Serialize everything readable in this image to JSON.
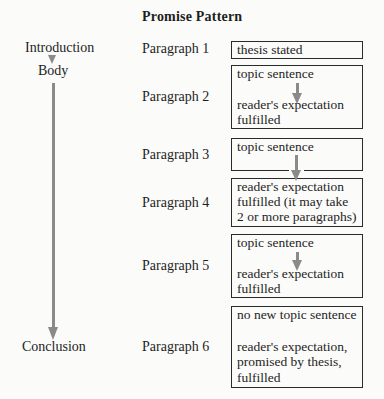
{
  "title": "Promise Pattern",
  "sections": {
    "introduction": "Introduction",
    "body": "Body",
    "conclusion": "Conclusion"
  },
  "paragraphs": [
    {
      "label": "Paragraph 1",
      "box": [
        "thesis stated"
      ]
    },
    {
      "label": "Paragraph 2",
      "box": [
        "topic sentence",
        "reader's expectation",
        "fulfilled"
      ]
    },
    {
      "label": "Paragraph 3",
      "box": [
        "topic sentence"
      ]
    },
    {
      "label": "Paragraph 4",
      "box": [
        "reader's expectation",
        "fulfilled (it may take",
        "2 or more paragraphs)"
      ]
    },
    {
      "label": "Paragraph 5",
      "box": [
        "topic sentence",
        "reader's expectation",
        "fulfilled"
      ]
    },
    {
      "label": "Paragraph 6",
      "box": [
        "no new topic sentence",
        "reader's expectation,",
        "promised by thesis,",
        "fulfilled"
      ]
    }
  ],
  "colors": {
    "arrow": "#8a8a8a",
    "border": "#2a2a2a",
    "text": "#1e1e1e",
    "background": "#fbfbfa"
  }
}
